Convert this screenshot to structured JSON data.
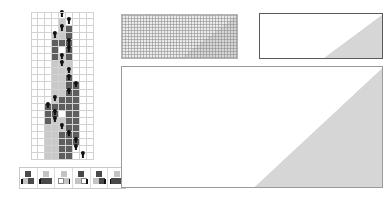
{
  "figure": {
    "title": "",
    "caption": ""
  },
  "colors": {
    "background": "#ffffff",
    "cell_white": "#ffffff",
    "cell_light": "#c9c9c9",
    "cell_dark": "#5e5e5e",
    "fractal_dark": "#6a6a6a",
    "fractal_light": "#d6d6d6",
    "grid_line": "#d2d2d2",
    "panel_border": "#9a9a9a",
    "head_marker": "#111111"
  },
  "panels": {
    "evolution": {
      "name": "Turing machine step-by-step evolution",
      "columns": 9,
      "rows": 21,
      "grid_visible": true,
      "states": [
        "white",
        "light",
        "dark"
      ],
      "rows_data": [
        {
          "cells": [
            "w",
            "w",
            "w",
            "w",
            "w",
            "w",
            "w",
            "w",
            "w"
          ],
          "head": 4
        },
        {
          "cells": [
            "w",
            "w",
            "w",
            "w",
            "l",
            "w",
            "w",
            "w",
            "w"
          ],
          "head": 5
        },
        {
          "cells": [
            "w",
            "w",
            "w",
            "w",
            "l",
            "d",
            "w",
            "w",
            "w"
          ],
          "head": 4
        },
        {
          "cells": [
            "w",
            "w",
            "w",
            "l",
            "l",
            "d",
            "w",
            "w",
            "w"
          ],
          "head": 3
        },
        {
          "cells": [
            "w",
            "w",
            "w",
            "d",
            "d",
            "d",
            "w",
            "w",
            "w"
          ],
          "head": 5
        },
        {
          "cells": [
            "w",
            "w",
            "w",
            "d",
            "w",
            "d",
            "w",
            "w",
            "w"
          ],
          "head": 5
        },
        {
          "cells": [
            "w",
            "w",
            "w",
            "d",
            "l",
            "d",
            "w",
            "w",
            "w"
          ],
          "head": 4
        },
        {
          "cells": [
            "w",
            "w",
            "w",
            "l",
            "l",
            "l",
            "w",
            "w",
            "w"
          ],
          "head": 4
        },
        {
          "cells": [
            "w",
            "w",
            "w",
            "l",
            "l",
            "l",
            "w",
            "w",
            "w"
          ],
          "head": 5
        },
        {
          "cells": [
            "w",
            "w",
            "w",
            "l",
            "l",
            "d",
            "w",
            "w",
            "w"
          ],
          "head": 5
        },
        {
          "cells": [
            "w",
            "w",
            "w",
            "l",
            "l",
            "d",
            "d",
            "w",
            "w"
          ],
          "head": 6
        },
        {
          "cells": [
            "w",
            "w",
            "w",
            "l",
            "l",
            "d",
            "d",
            "w",
            "w"
          ],
          "head": 5
        },
        {
          "cells": [
            "w",
            "w",
            "w",
            "l",
            "d",
            "d",
            "d",
            "w",
            "w"
          ],
          "head": 3
        },
        {
          "cells": [
            "w",
            "w",
            "d",
            "d",
            "d",
            "d",
            "d",
            "w",
            "w"
          ],
          "head": 2
        },
        {
          "cells": [
            "w",
            "w",
            "d",
            "d",
            "w",
            "d",
            "d",
            "w",
            "w"
          ],
          "head": 3
        },
        {
          "cells": [
            "w",
            "w",
            "d",
            "l",
            "l",
            "d",
            "d",
            "w",
            "w"
          ],
          "head": 3
        },
        {
          "cells": [
            "w",
            "w",
            "l",
            "l",
            "l",
            "d",
            "d",
            "w",
            "w"
          ],
          "head": 4
        },
        {
          "cells": [
            "w",
            "w",
            "l",
            "l",
            "d",
            "d",
            "d",
            "w",
            "w"
          ],
          "head": 5
        },
        {
          "cells": [
            "w",
            "w",
            "l",
            "l",
            "d",
            "d",
            "d",
            "w",
            "w"
          ],
          "head": 6
        },
        {
          "cells": [
            "w",
            "w",
            "l",
            "l",
            "d",
            "d",
            "w",
            "w",
            "w"
          ],
          "head": 6
        },
        {
          "cells": [
            "w",
            "w",
            "l",
            "l",
            "d",
            "d",
            "w",
            "w",
            "w"
          ],
          "head": 7
        }
      ]
    },
    "rule_strip": {
      "name": "Substitution rule icons",
      "rules": [
        {
          "id": "rule-1",
          "top": "dark",
          "left": "light",
          "right": "dark",
          "tick": "left"
        },
        {
          "id": "rule-2",
          "top": "light",
          "left": "dark",
          "right": "dark",
          "tick": "left"
        },
        {
          "id": "rule-3",
          "top": "light",
          "left": "white",
          "right": "light",
          "tick": "right"
        },
        {
          "id": "rule-4",
          "top": "dark",
          "left": "light",
          "right": "white",
          "tick": "right"
        },
        {
          "id": "rule-5",
          "top": "dark",
          "left": "light",
          "right": "dark",
          "tick": "right"
        },
        {
          "id": "rule-6",
          "top": "light",
          "left": "dark",
          "right": "dark",
          "tick": "left"
        }
      ]
    },
    "ca_grid": {
      "name": "Cellular automaton with visible grid",
      "width_cells": 78,
      "height_cells": 30,
      "grid_visible": true,
      "left_region": "solid light triangle",
      "right_region": "fractal dark pattern"
    },
    "ca_medium": {
      "name": "Cellular automaton medium scale",
      "width_cells": 248,
      "height_cells": 92,
      "grid_visible": false,
      "left_region": "solid light triangle",
      "right_region": "fractal dark pattern"
    },
    "ca_large": {
      "name": "Cellular automaton large scale",
      "width_cells": 524,
      "height_cells": 244,
      "grid_visible": false,
      "left_region": "solid light triangle",
      "right_region": "fractal dark pattern",
      "apex_fraction": 0.5
    }
  }
}
